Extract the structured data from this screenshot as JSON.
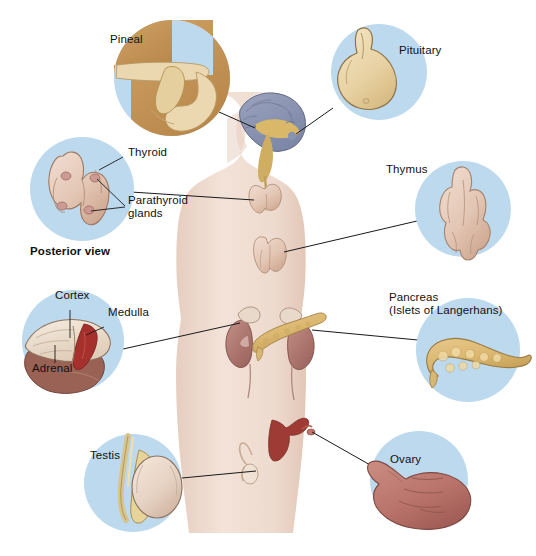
{
  "figure": {
    "view_note": "Posterior view",
    "background_color": "#ffffff",
    "circle_fill": "#bdd9ee",
    "pineal_circle_fill": "#c79a5a",
    "body_fill": "#f0ddd2",
    "leader_line_color": "#1a1a1a",
    "label_color": "#111111"
  },
  "labels": {
    "pineal": "Pineal",
    "pituitary": "Pituitary",
    "thyroid": "Thyroid",
    "parathyroid_line1": "Parathyroid",
    "parathyroid_line2": "glands",
    "posterior_view": "Posterior view",
    "thymus": "Thymus",
    "cortex": "Cortex",
    "medulla": "Medulla",
    "adrenal": "Adrenal",
    "pancreas_line1": "Pancreas",
    "pancreas_line2": "(Islets of Langerhans)",
    "testis": "Testis",
    "ovary": "Ovary"
  },
  "insets": [
    {
      "name": "pineal-inset",
      "label": "Pineal",
      "cx": 172,
      "cy": 78,
      "r": 58,
      "fill": "#c79a5a"
    },
    {
      "name": "pituitary-inset",
      "label": "Pituitary",
      "cx": 379,
      "cy": 72,
      "r": 48,
      "fill": "#bdd9ee"
    },
    {
      "name": "thyroid-parathyroid-inset",
      "label": "Thyroid / Parathyroid glands",
      "cx": 82,
      "cy": 189,
      "r": 52,
      "fill": "#bdd9ee"
    },
    {
      "name": "thymus-inset",
      "label": "Thymus",
      "cx": 463,
      "cy": 209,
      "r": 48,
      "fill": "#bdd9ee"
    },
    {
      "name": "adrenal-inset",
      "label": "Adrenal",
      "cx": 73,
      "cy": 341,
      "r": 51,
      "fill": "#bdd9ee"
    },
    {
      "name": "pancreas-inset",
      "label": "Pancreas (Islets of Langerhans)",
      "cx": 468,
      "cy": 350,
      "r": 52,
      "fill": "#bdd9ee"
    },
    {
      "name": "testis-inset",
      "label": "Testis",
      "cx": 133,
      "cy": 483,
      "r": 49,
      "fill": "#bdd9ee"
    },
    {
      "name": "ovary-inset",
      "label": "Ovary",
      "cx": 419,
      "cy": 480,
      "r": 49,
      "fill": "#bdd9ee"
    }
  ],
  "body_organs": [
    {
      "name": "brain",
      "label": "Brain with pineal and pituitary"
    },
    {
      "name": "thyroid-gland",
      "label": "Thyroid gland"
    },
    {
      "name": "thymus-gland",
      "label": "Thymus gland"
    },
    {
      "name": "kidneys-adrenals",
      "label": "Kidneys with adrenal glands"
    },
    {
      "name": "pancreas-organ",
      "label": "Pancreas"
    },
    {
      "name": "uterus-ovary",
      "label": "Uterus and ovary"
    },
    {
      "name": "testis-organ",
      "label": "Testis"
    }
  ]
}
